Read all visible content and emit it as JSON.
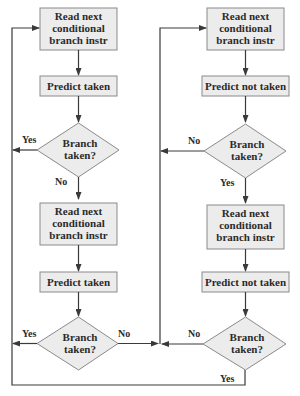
{
  "colors": {
    "box_fill": "#ececec",
    "box_stroke": "#8a8a8a",
    "line": "#3a3a3a",
    "text": "#2b2b2b"
  },
  "left": {
    "read1": [
      "Read next",
      "conditional",
      "branch instr"
    ],
    "predict1": "Predict taken",
    "decision1": [
      "Branch",
      "taken?"
    ],
    "decision1_yes": "Yes",
    "decision1_no": "No",
    "read2": [
      "Read next",
      "conditional",
      "branch instr"
    ],
    "predict2": "Predict taken",
    "decision2": [
      "Branch",
      "taken?"
    ],
    "decision2_yes": "Yes",
    "decision2_no": "No"
  },
  "right": {
    "read1": [
      "Read next",
      "conditional",
      "branch instr"
    ],
    "predict1": "Predict not taken",
    "decision1": [
      "Branch",
      "taken?"
    ],
    "decision1_no": "No",
    "decision1_yes": "Yes",
    "read2": [
      "Read next",
      "conditional",
      "branch instr"
    ],
    "predict2": "Predict not taken",
    "decision2": [
      "Branch",
      "taken?"
    ],
    "decision2_no": "No",
    "decision2_yes": "Yes"
  }
}
